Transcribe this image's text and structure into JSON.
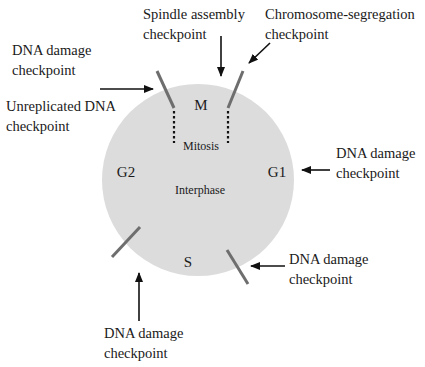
{
  "diagram": {
    "colors": {
      "cell_fill": "#dcdcdc",
      "checkpoint_bar": "#6e6e6e",
      "arrow": "#111111",
      "text": "#1a1a1a"
    },
    "phases": {
      "m": "M",
      "mitosis": "Mitosis",
      "g1": "G1",
      "g2": "G2",
      "s": "S",
      "interphase": "Interphase"
    },
    "checkpoints": [
      {
        "id": "dna-damage-g2",
        "line1": "DNA damage",
        "line2": "checkpoint"
      },
      {
        "id": "unreplicated-dna",
        "line1": "Unreplicated DNA",
        "line2": "checkpoint"
      },
      {
        "id": "spindle-assembly",
        "line1": "Spindle assembly",
        "line2": "checkpoint"
      },
      {
        "id": "chromosome-segregation",
        "line1": "Chromosome-segregation",
        "line2": "checkpoint"
      },
      {
        "id": "dna-damage-g1",
        "line1": "DNA damage",
        "line2": "checkpoint"
      },
      {
        "id": "dna-damage-s",
        "line1": "DNA damage",
        "line2": "checkpoint"
      },
      {
        "id": "dna-damage-g1s",
        "line1": "DNA damage",
        "line2": "checkpoint"
      }
    ]
  }
}
